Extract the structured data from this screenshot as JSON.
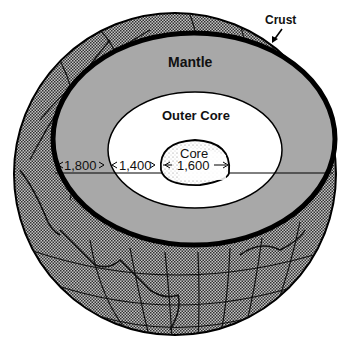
{
  "diagram": {
    "type": "earth-cross-section",
    "layers": [
      {
        "id": "crust",
        "label": "Crust"
      },
      {
        "id": "mantle",
        "label": "Mantle",
        "thickness": "1,800"
      },
      {
        "id": "outer-core",
        "label": "Outer Core",
        "thickness": "1,400"
      },
      {
        "id": "inner-core",
        "label": "Core",
        "thickness": "1,600"
      }
    ],
    "colors": {
      "mantle": "#a8a8a8",
      "outer_core": "#ffffff",
      "globe_texture_dark": "#222222",
      "globe_texture_light": "#bdbdbd",
      "outline": "#000000"
    }
  }
}
